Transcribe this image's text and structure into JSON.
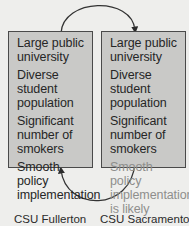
{
  "diagram": {
    "left_box": {
      "label": "CSU Fullerton",
      "items": [
        {
          "text": "Large public university",
          "faded": false
        },
        {
          "text": "Diverse student population",
          "faded": false
        },
        {
          "text": "Significant number of smokers",
          "faded": false
        },
        {
          "text": "Smooth policy implementation",
          "faded": false
        }
      ]
    },
    "right_box": {
      "label": "CSU Sacramento",
      "items": [
        {
          "text": "Large public university",
          "faded": false
        },
        {
          "text": "Diverse student population",
          "faded": false
        },
        {
          "text": "Significant number of smokers",
          "faded": false
        },
        {
          "text": "Smooth policy implementation is likely",
          "faded": true
        }
      ]
    },
    "arrows": [
      {
        "from": "left_box",
        "to": "right_box",
        "position": "top"
      },
      {
        "from": "right_box",
        "to": "left_box",
        "position": "bottom"
      }
    ],
    "colors": {
      "background": "#eeeeec",
      "box_fill": "#c9c9c7",
      "box_border": "#4a4a4a",
      "text": "#262626",
      "faded_text": "#8e8e8c",
      "arrow": "#333333"
    }
  }
}
